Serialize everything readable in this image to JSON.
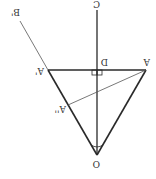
{
  "diagram": {
    "orientation": "rotated 180 degrees",
    "labels": {
      "O": "O",
      "C": "C",
      "D": "D",
      "A": "A",
      "A_prime": "A'",
      "A_double_prime": "A''",
      "B_prime": "B'"
    },
    "colors": {
      "line": "#2a2a2a",
      "thin_line": "#555555",
      "background": "#ffffff"
    }
  }
}
